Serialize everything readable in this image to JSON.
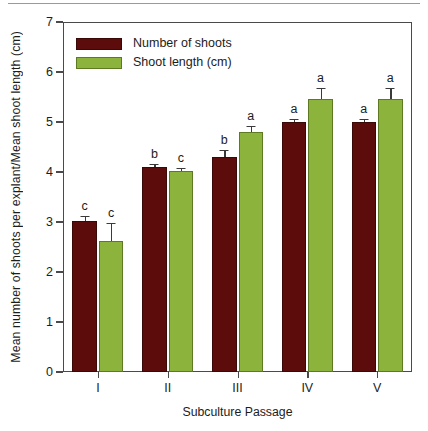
{
  "chart_data": {
    "type": "bar",
    "title": "",
    "xlabel": "Subculture Passage",
    "ylabel": "Mean number of shoots per explant/Mean shoot length (cm)",
    "categories": [
      "I",
      "II",
      "III",
      "IV",
      "V"
    ],
    "ylim": [
      0,
      7
    ],
    "yticks": [
      0,
      1,
      2,
      3,
      4,
      5,
      6,
      7
    ],
    "ytick_labels": [
      "0",
      "1",
      "2",
      "3",
      "4",
      "5",
      "6",
      "7"
    ],
    "grid": false,
    "legend_position": "top-left",
    "series": [
      {
        "name": "Number of shoots",
        "color": "#5c0d0b",
        "values": [
          3.03,
          4.1,
          4.3,
          5.01,
          5.0
        ],
        "errors": [
          0.09,
          0.07,
          0.14,
          0.06,
          0.07
        ],
        "letters": [
          "c",
          "b",
          "b",
          "a",
          "a"
        ]
      },
      {
        "name": "Shoot length (cm)",
        "color": "#8cb43c",
        "values": [
          2.63,
          4.03,
          4.8,
          5.46,
          5.46
        ],
        "errors": [
          0.35,
          0.06,
          0.13,
          0.23,
          0.22
        ],
        "letters": [
          "c",
          "c",
          "a",
          "a",
          "a"
        ]
      }
    ]
  },
  "legend": {
    "items": [
      {
        "label": "Number of shoots",
        "color": "#5c0d0b"
      },
      {
        "label": "Shoot length (cm)",
        "color": "#8cb43c"
      }
    ]
  },
  "axes": {
    "y_title": "Mean number of shoots per explant/Mean shoot length (cm)",
    "x_title": "Subculture Passage"
  },
  "colors": {
    "series_dark_red": "#5c0d0b",
    "series_olive_green": "#8cb43c",
    "axis": "#4a4a4a",
    "top_rule": "#9a9a9a",
    "background": "#ffffff"
  }
}
